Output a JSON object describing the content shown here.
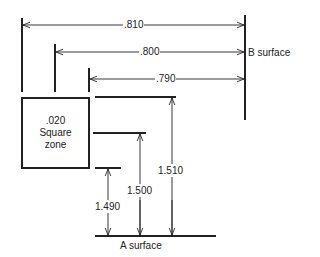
{
  "diagram": {
    "horizontal_dimensions": [
      {
        "label": ".810",
        "y": 25,
        "x_from": 22,
        "x_to": 245
      },
      {
        "label": ".800",
        "y": 52,
        "x_from": 55,
        "x_to": 245
      },
      {
        "label": ".790",
        "y": 79,
        "x_from": 89,
        "x_to": 245
      }
    ],
    "vertical_dimensions": [
      {
        "label": "1.510",
        "x": 172,
        "y_from": 97,
        "y_to": 236
      },
      {
        "label": "1.500",
        "x": 140,
        "y_from": 133,
        "y_to": 236
      },
      {
        "label": "1.490",
        "x": 108,
        "y_from": 168,
        "y_to": 236
      }
    ],
    "zone": {
      "line1": ".020",
      "line2": "Square",
      "line3": "zone"
    },
    "b_surface_label": "B surface",
    "a_surface_label": "A surface",
    "colors": {
      "ink": "#222222",
      "background": "#ffffff"
    }
  }
}
